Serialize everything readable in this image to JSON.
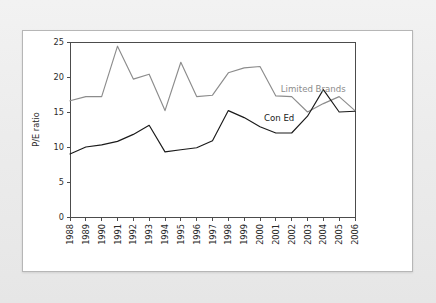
{
  "colors": {
    "page_background": "#ececec",
    "panel_background": "#ffffff",
    "panel_border": "#b6b6b6",
    "axis": "#4c4c4c",
    "series_limited_brands": "#8c8c8c",
    "series_con_ed": "#1a1a1a",
    "text": "#2b2b2b"
  },
  "chart_data": {
    "type": "line",
    "title": "",
    "subtitle": "",
    "xlabel": "",
    "ylabel": "P/E ratio",
    "ylim": [
      0,
      25
    ],
    "yticks": [
      "0",
      "5",
      "10",
      "15",
      "20",
      "25"
    ],
    "ytick_values": [
      0,
      5,
      10,
      15,
      20,
      25
    ],
    "grid": false,
    "legend_position": "inline-annotation",
    "categories": [
      "1988",
      "1989",
      "1990",
      "1991",
      "1992",
      "1993",
      "1994",
      "1995",
      "1996",
      "1997",
      "1998",
      "1999",
      "2000",
      "2001",
      "2002",
      "2003",
      "2004",
      "2005",
      "2006"
    ],
    "series": [
      {
        "name": "Limited Brands",
        "color": "#8c8c8c",
        "label_x_year": "2001",
        "values": [
          16.6,
          17.2,
          17.2,
          24.4,
          19.7,
          20.4,
          15.2,
          22.1,
          17.2,
          17.4,
          20.6,
          21.3,
          21.5,
          17.3,
          17.2,
          15.0,
          16.2,
          17.2,
          15.2
        ]
      },
      {
        "name": "Con Ed",
        "color": "#1a1a1a",
        "label_x_year": "2000",
        "values": [
          9.0,
          10.0,
          10.3,
          10.8,
          11.8,
          13.1,
          9.3,
          9.6,
          9.9,
          10.9,
          15.2,
          14.2,
          12.9,
          12.0,
          12.0,
          14.4,
          18.2,
          15.0,
          15.1
        ]
      }
    ]
  }
}
